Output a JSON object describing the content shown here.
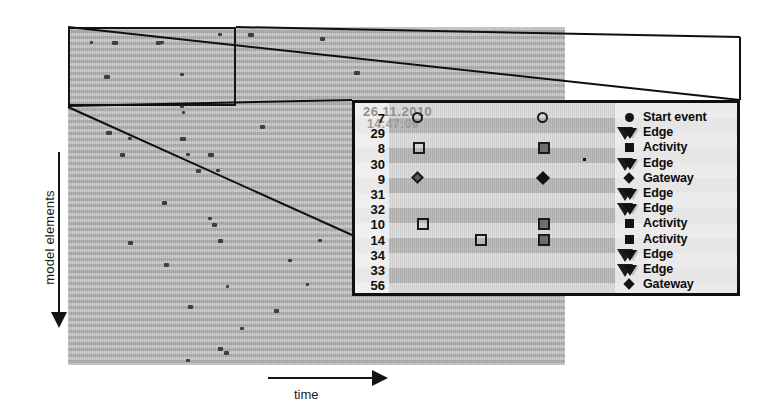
{
  "axes": {
    "y_label": "model elements",
    "x_label": "time"
  },
  "detail": {
    "timestamp_date": "26.11.2010",
    "timestamp_time": "14:47:09",
    "row_labels": [
      "7",
      "29",
      "8",
      "30",
      "9",
      "31",
      "32",
      "10",
      "14",
      "34",
      "33",
      "56"
    ],
    "legend": [
      {
        "label": "Start event",
        "glyph": "circle-filled-icon"
      },
      {
        "label": "Edge",
        "glyph": "triangle-down-filled-icon"
      },
      {
        "label": "Activity",
        "glyph": "square-filled-icon"
      },
      {
        "label": "Edge",
        "glyph": "triangle-down-filled-icon"
      },
      {
        "label": "Gateway",
        "glyph": "diamond-filled-icon"
      },
      {
        "label": "Edge",
        "glyph": "triangle-down-filled-icon"
      },
      {
        "label": "Edge",
        "glyph": "triangle-down-filled-icon"
      },
      {
        "label": "Activity",
        "glyph": "square-filled-icon"
      },
      {
        "label": "Activity",
        "glyph": "square-filled-icon"
      },
      {
        "label": "Edge",
        "glyph": "triangle-down-filled-icon"
      },
      {
        "label": "Edge",
        "glyph": "triangle-down-filled-icon"
      },
      {
        "label": "Gateway",
        "glyph": "diamond-filled-icon"
      }
    ]
  },
  "chart_data": {
    "type": "scatter",
    "title": "",
    "xlabel": "time",
    "ylabel": "model elements",
    "grid": "horizontal-banded",
    "legend_position": "right",
    "categories": [
      "7",
      "29",
      "8",
      "30",
      "9",
      "31",
      "32",
      "10",
      "14",
      "34",
      "33",
      "56"
    ],
    "series": [
      {
        "name": "Start event",
        "marker": "circle",
        "points": [
          {
            "row": "7",
            "x": 57,
            "style": "open"
          },
          {
            "row": "7",
            "x": 182,
            "style": "open"
          }
        ]
      },
      {
        "name": "Activity",
        "marker": "square",
        "points": [
          {
            "row": "8",
            "x": 58,
            "style": "open"
          },
          {
            "row": "8",
            "x": 183,
            "style": "filled"
          },
          {
            "row": "10",
            "x": 62,
            "style": "open"
          },
          {
            "row": "10",
            "x": 183,
            "style": "filled"
          },
          {
            "row": "14",
            "x": 120,
            "style": "open"
          },
          {
            "row": "14",
            "x": 183,
            "style": "filled"
          }
        ]
      },
      {
        "name": "Gateway",
        "marker": "diamond",
        "points": [
          {
            "row": "9",
            "x": 58,
            "style": "open"
          },
          {
            "row": "9",
            "x": 183,
            "style": "filled"
          }
        ]
      },
      {
        "name": "Edge",
        "marker": "triangle-down",
        "points": [
          {
            "row": "29",
            "x": 262,
            "style": "open"
          },
          {
            "row": "30",
            "x": 262,
            "style": "open"
          },
          {
            "row": "31",
            "x": 262,
            "style": "open"
          },
          {
            "row": "32",
            "x": 262,
            "style": "open"
          },
          {
            "row": "34",
            "x": 262,
            "style": "open"
          },
          {
            "row": "33",
            "x": 262,
            "style": "open"
          }
        ]
      },
      {
        "name": "Noise point",
        "marker": "dot",
        "points": [
          {
            "row": "30",
            "x": 228,
            "style": "filled"
          }
        ]
      }
    ],
    "overview_points": [
      {
        "x": 22,
        "y": 14
      },
      {
        "x": 44,
        "y": 14
      },
      {
        "x": 88,
        "y": 14
      },
      {
        "x": 92,
        "y": 14
      },
      {
        "x": 150,
        "y": 6
      },
      {
        "x": 180,
        "y": 6
      },
      {
        "x": 252,
        "y": 10
      },
      {
        "x": 36,
        "y": 48
      },
      {
        "x": 112,
        "y": 46
      },
      {
        "x": 286,
        "y": 44
      },
      {
        "x": 112,
        "y": 78
      },
      {
        "x": 114,
        "y": 84
      },
      {
        "x": 38,
        "y": 104
      },
      {
        "x": 60,
        "y": 110
      },
      {
        "x": 112,
        "y": 110
      },
      {
        "x": 192,
        "y": 98
      },
      {
        "x": 294,
        "y": 100
      },
      {
        "x": 318,
        "y": 98
      },
      {
        "x": 420,
        "y": 96
      },
      {
        "x": 440,
        "y": 96
      },
      {
        "x": 52,
        "y": 126
      },
      {
        "x": 118,
        "y": 126
      },
      {
        "x": 140,
        "y": 126
      },
      {
        "x": 320,
        "y": 124
      },
      {
        "x": 428,
        "y": 124
      },
      {
        "x": 452,
        "y": 124
      },
      {
        "x": 128,
        "y": 142
      },
      {
        "x": 148,
        "y": 142
      },
      {
        "x": 334,
        "y": 148
      },
      {
        "x": 340,
        "y": 152
      },
      {
        "x": 440,
        "y": 148
      },
      {
        "x": 444,
        "y": 154
      },
      {
        "x": 448,
        "y": 160
      },
      {
        "x": 94,
        "y": 174
      },
      {
        "x": 340,
        "y": 172
      },
      {
        "x": 446,
        "y": 170
      },
      {
        "x": 140,
        "y": 190
      },
      {
        "x": 144,
        "y": 196
      },
      {
        "x": 336,
        "y": 190
      },
      {
        "x": 444,
        "y": 190
      },
      {
        "x": 60,
        "y": 214
      },
      {
        "x": 150,
        "y": 212
      },
      {
        "x": 250,
        "y": 212
      },
      {
        "x": 96,
        "y": 236
      },
      {
        "x": 220,
        "y": 232
      },
      {
        "x": 158,
        "y": 258
      },
      {
        "x": 238,
        "y": 256
      },
      {
        "x": 120,
        "y": 278
      },
      {
        "x": 206,
        "y": 282
      },
      {
        "x": 172,
        "y": 300
      },
      {
        "x": 150,
        "y": 320
      },
      {
        "x": 156,
        "y": 324
      },
      {
        "x": 118,
        "y": 332
      }
    ]
  }
}
